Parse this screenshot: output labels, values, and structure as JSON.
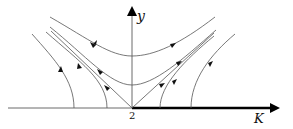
{
  "diagram": {
    "type": "phase-portrait",
    "axes": {
      "horizontal_label": "K",
      "vertical_label": "y",
      "origin_tick": "2"
    },
    "colors": {
      "curve": "#555555",
      "axis": "#333333",
      "thick_axis": "#000000"
    }
  }
}
